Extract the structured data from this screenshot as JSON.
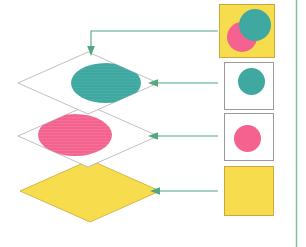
{
  "figure": {
    "background_color": "#ffffff",
    "width": 306,
    "height": 247
  },
  "palette": {
    "teal": "#3FA8A0",
    "pink": "#F5628F",
    "yellow": "#F7DC4E",
    "yellow_border": "#C9A93A",
    "connector_green": "#4FA87E",
    "panel_border": "#9A9A9A",
    "diamond_outline": "#B0B0B0",
    "right_rule": "#7FBF96"
  },
  "layers": [
    {
      "id": "layer-teal",
      "label": "teal-ellipse-layer",
      "fill": "none",
      "outline": "#B0B0B0",
      "shape_fill_color": "#3FA8A0",
      "shape": "ellipse"
    },
    {
      "id": "layer-pink",
      "label": "pink-ellipse-layer",
      "fill": "none",
      "outline": "#B0B0B0",
      "shape_fill_color": "#F5628F",
      "shape": "ellipse"
    },
    {
      "id": "layer-yellow",
      "label": "yellow-base-layer",
      "fill": "#F7DC4E",
      "outline": "#C9A93A",
      "shape_fill_color": "#F7DC4E",
      "shape": "solid"
    }
  ],
  "panels": [
    {
      "id": "panel-composite",
      "label": "composite-result-panel",
      "background": "#F7DC4E",
      "border": "#C9A93A",
      "contents": [
        "teal-circle",
        "pink-circle"
      ]
    },
    {
      "id": "panel-teal",
      "label": "teal-circle-panel",
      "background": "#ffffff",
      "border": "#9A9A9A",
      "contents": [
        "teal-circle"
      ]
    },
    {
      "id": "panel-pink",
      "label": "pink-circle-panel",
      "background": "#ffffff",
      "border": "#9A9A9A",
      "contents": [
        "pink-circle"
      ]
    },
    {
      "id": "panel-yellow",
      "label": "yellow-fill-panel",
      "background": "#F7DC4E",
      "border": "#C9A93A",
      "contents": []
    }
  ],
  "connectors": [
    {
      "id": "connector-composite",
      "from": "panel-composite",
      "to": "layer-teal",
      "arrow_direction": "down",
      "color": "#4FA87E"
    },
    {
      "id": "connector-teal",
      "from": "panel-teal",
      "to": "layer-teal",
      "arrow_direction": "left",
      "color": "#4FA87E"
    },
    {
      "id": "connector-pink",
      "from": "panel-pink",
      "to": "layer-pink",
      "arrow_direction": "left",
      "color": "#4FA87E"
    },
    {
      "id": "connector-yellow",
      "from": "panel-yellow",
      "to": "layer-yellow",
      "arrow_direction": "left",
      "color": "#4FA87E"
    }
  ]
}
